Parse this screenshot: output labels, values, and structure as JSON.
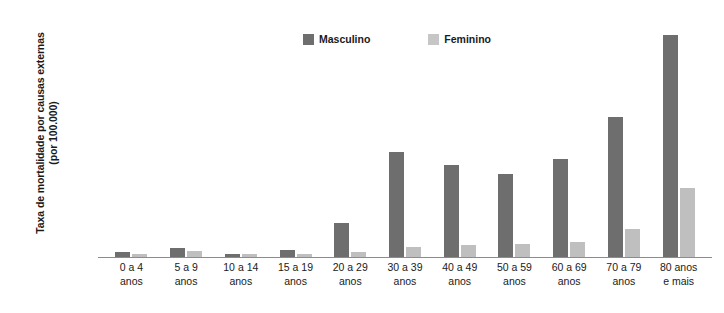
{
  "chart_data": {
    "type": "bar",
    "title": "",
    "xlabel": "",
    "ylabel": "Taxa de mortalidade por causas externas (por 100.000)",
    "ylim": [
      0,
      400
    ],
    "ytick_step": 50,
    "yticks": [
      "400",
      "350",
      "300",
      "250",
      "200",
      "150",
      "100",
      "50",
      "0"
    ],
    "grid": false,
    "legend_position": "top-center",
    "categories": [
      "0 a 4 anos",
      "5 a 9 anos",
      "10 a 14 anos",
      "15 a 19 anos",
      "20 a 29 anos",
      "30 a 39 anos",
      "40 a 49 anos",
      "50 a 59 anos",
      "60 a 69 anos",
      "70 a 79 anos",
      "80 anos e mais"
    ],
    "category_lines": [
      {
        "line1": "0 a 4",
        "line2": "anos"
      },
      {
        "line1": "5 a 9",
        "line2": "anos"
      },
      {
        "line1": "10 a 14",
        "line2": "anos"
      },
      {
        "line1": "15 a 19",
        "line2": "anos"
      },
      {
        "line1": "20 a 29",
        "line2": "anos"
      },
      {
        "line1": "30 a 39",
        "line2": "anos"
      },
      {
        "line1": "40 a 49",
        "line2": "anos"
      },
      {
        "line1": "50 a 59",
        "line2": "anos"
      },
      {
        "line1": "60 a 69",
        "line2": "anos"
      },
      {
        "line1": "70 a 79",
        "line2": "anos"
      },
      {
        "line1": "80 anos",
        "line2": "e mais"
      }
    ],
    "series": [
      {
        "name": "Masculino",
        "color": "#6e6e6e",
        "values": [
          9,
          16,
          6,
          12,
          58,
          180,
          158,
          143,
          168,
          240,
          382
        ]
      },
      {
        "name": "Feminino",
        "color": "#bfbfbf",
        "values": [
          6,
          11,
          5,
          5,
          9,
          18,
          20,
          22,
          26,
          48,
          119
        ]
      }
    ]
  },
  "legend": {
    "items": [
      {
        "label": "Masculino",
        "color": "#6e6e6e"
      },
      {
        "label": "Feminino",
        "color": "#c6c6c6"
      }
    ]
  },
  "axis": {
    "y_title_line1": "Taxa de mortalidade por causas",
    "y_title_line2": "externas (por 100.000)"
  }
}
